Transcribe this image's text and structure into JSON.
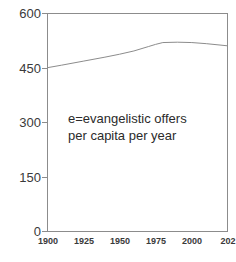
{
  "chart_data": {
    "type": "line",
    "title": "",
    "subtitle": "",
    "xlabel": "",
    "ylabel": "",
    "xlim": [
      1900,
      2025
    ],
    "ylim": [
      0,
      600
    ],
    "grid": false,
    "legend_position": "none",
    "x_ticks": [
      "1900",
      "1925",
      "1950",
      "1975",
      "2000",
      "202"
    ],
    "x_tick_values": [
      1900,
      1925,
      1950,
      1975,
      2000,
      2025
    ],
    "y_ticks": [
      "0",
      "150",
      "300",
      "450",
      "600"
    ],
    "y_tick_values": [
      0,
      150,
      300,
      450,
      600
    ],
    "series": [
      {
        "name": "e",
        "color": "#8c8c8c",
        "x": [
          1900,
          1910,
          1925,
          1940,
          1950,
          1960,
          1970,
          1975,
          1980,
          1990,
          2000,
          2010,
          2025
        ],
        "values": [
          450,
          457,
          468,
          479,
          487,
          496,
          508,
          514,
          519,
          520,
          519,
          516,
          510
        ]
      }
    ],
    "annotations": [
      {
        "name": "series-definition",
        "line1": "e=evangelistic offers",
        "line2": "per capita per year"
      }
    ]
  },
  "colors": {
    "axis": "#8c8c8c",
    "line": "#8c8c8c",
    "text": "#3a3a3a",
    "annotation_text": "#2b2b2b",
    "background": "#ffffff"
  }
}
